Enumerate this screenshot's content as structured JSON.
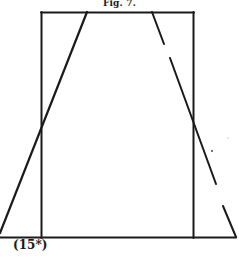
{
  "figure": {
    "title": "Fig. 7.",
    "label": "(15*)",
    "colors": {
      "ink": "#1a1a1a",
      "background": "#ffffff"
    }
  }
}
